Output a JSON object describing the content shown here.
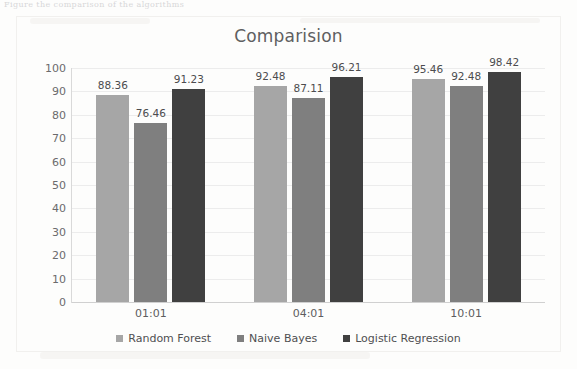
{
  "scan": {
    "top_cutoff_text": "Figure   the comparison of the algorithms"
  },
  "chart_data": {
    "type": "bar",
    "title": "Comparision",
    "xlabel": "",
    "ylabel": "",
    "categories": [
      "01:01",
      "04:01",
      "10:01"
    ],
    "series": [
      {
        "name": "Random Forest",
        "color": "#a6a6a6",
        "values": [
          88.36,
          92.48,
          95.46
        ]
      },
      {
        "name": "Naive Bayes",
        "color": "#7f7f7f",
        "values": [
          76.46,
          87.11,
          92.48
        ]
      },
      {
        "name": "Logistic Regression",
        "color": "#404040",
        "values": [
          91.23,
          96.21,
          98.42
        ]
      }
    ],
    "ylim": [
      0,
      100
    ],
    "ytick_step": 10,
    "ytick_labels": [
      "100",
      "90",
      "80",
      "70",
      "60",
      "50",
      "40",
      "30",
      "20",
      "10",
      "0"
    ],
    "data_labels": [
      [
        "88.36",
        "76.46",
        "91.23"
      ],
      [
        "92.48",
        "87.11",
        "96.21"
      ],
      [
        "95.46",
        "92.48",
        "98.42"
      ]
    ],
    "grid": true,
    "grid_axis": "y",
    "legend_position": "bottom"
  },
  "colors": {
    "background": "#fdfdfc",
    "title_text": "#5f5f61",
    "axis_text": "#6b6b6d",
    "gridline": "#ececec",
    "axis_line": "#d0d0d0"
  }
}
